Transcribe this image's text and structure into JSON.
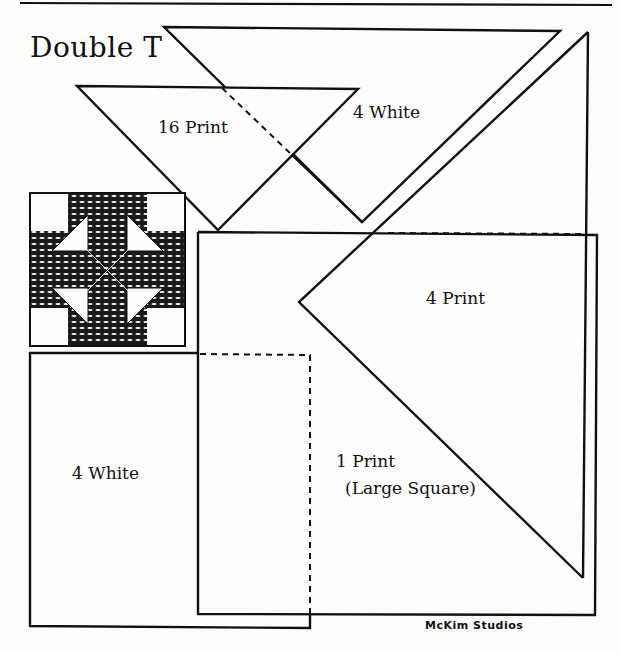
{
  "sheet": {
    "title": "Double T",
    "credit": "McKim Studios",
    "colors": {
      "ink": "#111111",
      "paper": "#fdfdfb",
      "print_fabric": "#1a1a1a"
    }
  },
  "pieces": [
    {
      "id": "small-triangle",
      "shape": "triangle",
      "label": "16 Print",
      "quantity": 16,
      "fabric": "Print"
    },
    {
      "id": "medium-triangle",
      "shape": "triangle",
      "label": "4 White",
      "quantity": 4,
      "fabric": "White"
    },
    {
      "id": "large-triangle",
      "shape": "triangle",
      "label": "4 Print",
      "quantity": 4,
      "fabric": "Print"
    },
    {
      "id": "rectangle",
      "shape": "rectangle",
      "label": "4 White",
      "quantity": 4,
      "fabric": "White"
    },
    {
      "id": "large-square",
      "shape": "square",
      "label_line1": "1 Print",
      "label_line2": "(Large Square)",
      "quantity": 1,
      "fabric": "Print"
    }
  ],
  "block_preview": {
    "name": "Double T block illustration"
  }
}
